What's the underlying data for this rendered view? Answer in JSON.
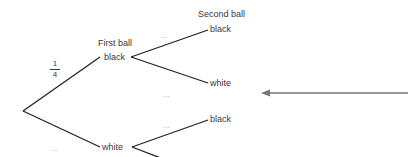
{
  "diagram": {
    "type": "probability-tree",
    "headers": {
      "first_ball": "First ball",
      "second_ball": "Second ball"
    },
    "root_branch_probability": {
      "numerator": "1",
      "denominator": "4"
    },
    "first_level": [
      {
        "label": "black",
        "probability": "1/4"
      },
      {
        "label": "white",
        "probability": "..."
      }
    ],
    "second_level": {
      "after_black": [
        {
          "label": "black",
          "probability": "..."
        },
        {
          "label": "white",
          "probability": "..."
        }
      ],
      "after_white": [
        {
          "label": "black",
          "probability": "..."
        },
        {
          "label": "white",
          "probability": "..."
        }
      ]
    },
    "placeholder": "...",
    "pointer_arrow": {
      "direction": "left",
      "color": "#777777",
      "points_to": "white (second ball, after black)"
    },
    "line_color": "#222222"
  }
}
